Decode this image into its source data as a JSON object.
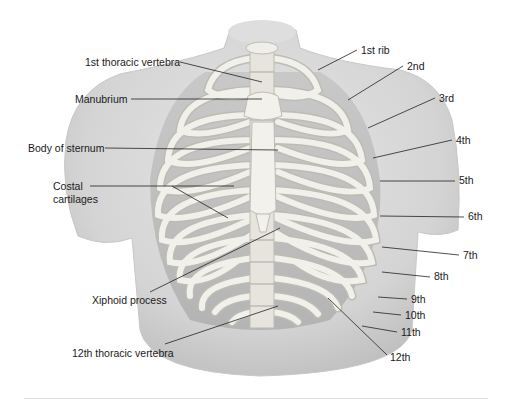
{
  "figure": {
    "labels_left": [
      {
        "id": "t1",
        "text": "1st thoracic vertebra",
        "x": 85,
        "y": 56
      },
      {
        "id": "manubrium",
        "text": "Manubrium",
        "x": 75,
        "y": 93
      },
      {
        "id": "body",
        "text": "Body of sternum",
        "x": 28,
        "y": 142
      },
      {
        "id": "costal1",
        "text": "Costal",
        "x": 53,
        "y": 180
      },
      {
        "id": "costal2",
        "text": "cartilages",
        "x": 53,
        "y": 193
      },
      {
        "id": "xiphoid",
        "text": "Xiphoid process",
        "x": 92,
        "y": 294
      },
      {
        "id": "t12",
        "text": "12th thoracic vertebra",
        "x": 72,
        "y": 347
      }
    ],
    "labels_right": [
      {
        "id": "rib1",
        "text": "1st rib",
        "x": 361,
        "y": 44
      },
      {
        "id": "rib2",
        "text": "2nd",
        "x": 407,
        "y": 60
      },
      {
        "id": "rib3",
        "text": "3rd",
        "x": 439,
        "y": 92
      },
      {
        "id": "rib4",
        "text": "4th",
        "x": 456,
        "y": 134
      },
      {
        "id": "rib5",
        "text": "5th",
        "x": 459,
        "y": 174
      },
      {
        "id": "rib6",
        "text": "6th",
        "x": 468,
        "y": 210
      },
      {
        "id": "rib7",
        "text": "7th",
        "x": 463,
        "y": 249
      },
      {
        "id": "rib8",
        "text": "8th",
        "x": 434,
        "y": 270
      },
      {
        "id": "rib9",
        "text": "9th",
        "x": 411,
        "y": 293
      },
      {
        "id": "rib10",
        "text": "10th",
        "x": 405,
        "y": 309
      },
      {
        "id": "rib11",
        "text": "11th",
        "x": 401,
        "y": 326
      },
      {
        "id": "rib12",
        "text": "12th",
        "x": 390,
        "y": 351
      }
    ]
  },
  "text": {
    "t1": "1st thoracic vertebra",
    "manubrium": "Manubrium",
    "body": "Body of sternum",
    "costal1": "Costal",
    "costal2": "cartilages",
    "xiphoid": "Xiphoid process",
    "t12": "12th thoracic vertebra",
    "rib1": "1st rib",
    "rib2": "2nd",
    "rib3": "3rd",
    "rib4": "4th",
    "rib5": "5th",
    "rib6": "6th",
    "rib7": "7th",
    "rib8": "8th",
    "rib9": "9th",
    "rib10": "10th",
    "rib11": "11th",
    "rib12": "12th"
  },
  "colors": {
    "torso": "#d9d9d9",
    "torso_shadow": "#c4c4c4",
    "bone": "#f1f0ea",
    "bone_edge": "#bdbcb4",
    "cavity": "#b8b8b8",
    "leader": "#222222"
  }
}
